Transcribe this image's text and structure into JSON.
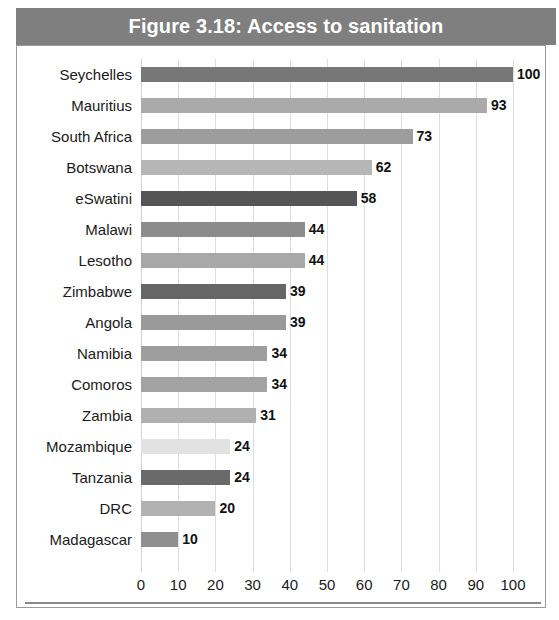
{
  "figure": {
    "title": "Figure 3.18: Access to sanitation",
    "title_bar_color": "#7f7f7f",
    "frame_border_color": "#9a9a9a",
    "gridline_color": "#dedede"
  },
  "chart_data": {
    "type": "bar",
    "orientation": "horizontal",
    "title": "Figure 3.18: Access to sanitation",
    "xlabel": "",
    "ylabel": "",
    "xlim": [
      0,
      100
    ],
    "xticks": [
      0,
      10,
      20,
      30,
      40,
      50,
      60,
      70,
      80,
      90,
      100
    ],
    "grid": true,
    "legend": "none",
    "categories": [
      "Seychelles",
      "Mauritius",
      "South Africa",
      "Botswana",
      "eSwatini",
      "Malawi",
      "Lesotho",
      "Zimbabwe",
      "Angola",
      "Namibia",
      "Comoros",
      "Zambia",
      "Mozambique",
      "Tanzania",
      "DRC",
      "Madagascar"
    ],
    "values": [
      100,
      93,
      73,
      62,
      58,
      44,
      44,
      39,
      39,
      34,
      34,
      31,
      24,
      24,
      20,
      10
    ],
    "data_labels": [
      "100",
      "93",
      "73",
      "62",
      "58",
      "44",
      "44",
      "39",
      "39",
      "34",
      "34",
      "31",
      "24",
      "24",
      "20",
      "10"
    ],
    "bar_colors": [
      "#777777",
      "#aaaaaa",
      "#9d9d9d",
      "#b6b6b6",
      "#555555",
      "#8c8c8c",
      "#a8a8a8",
      "#666666",
      "#9a9a9a",
      "#9e9e9e",
      "#a3a3a3",
      "#b0b0b0",
      "#e2e2e2",
      "#6a6a6a",
      "#b2b2b2",
      "#8f8f8f"
    ]
  }
}
